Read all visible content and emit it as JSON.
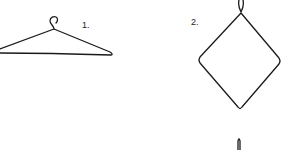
{
  "figure": {
    "items": [
      {
        "label": "1.",
        "description": "wire coat hanger"
      },
      {
        "label": "2.",
        "description": "hanger bent into diamond shape"
      }
    ],
    "stroke_color": "#1a1a1a",
    "background": "#ffffff"
  }
}
